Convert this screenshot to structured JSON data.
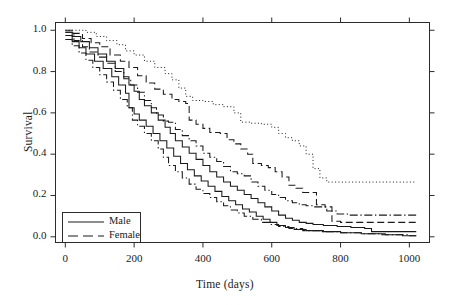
{
  "chart_data": {
    "type": "line",
    "title": "",
    "xlabel": "Time (days)",
    "ylabel": "Survival",
    "xlim": [
      -30,
      1060
    ],
    "ylim": [
      -0.03,
      1.04
    ],
    "xticks": [
      0,
      200,
      400,
      600,
      800,
      1000
    ],
    "xtick_labels": [
      "0",
      "200",
      "400",
      "600",
      "800",
      "1000"
    ],
    "yticks": [
      0.0,
      0.2,
      0.4,
      0.6,
      0.8,
      1.0
    ],
    "ytick_labels": [
      "0.0",
      "0.2",
      "0.4",
      "0.6",
      "0.8",
      "1.0"
    ],
    "grid": false,
    "legend_position": "lower left",
    "legend_entries": [
      {
        "label": "Male",
        "style": "solid"
      },
      {
        "label": "Female",
        "style": "dashed"
      }
    ],
    "series": [
      {
        "name": "Female group 1",
        "style": "dotted",
        "sex": "Female",
        "plateau": 0.265,
        "points": [
          [
            0,
            1.0
          ],
          [
            40,
            1.0
          ],
          [
            60,
            0.99
          ],
          [
            90,
            0.97
          ],
          [
            120,
            0.95
          ],
          [
            150,
            0.93
          ],
          [
            175,
            0.9
          ],
          [
            200,
            0.88
          ],
          [
            230,
            0.85
          ],
          [
            260,
            0.82
          ],
          [
            290,
            0.79
          ],
          [
            310,
            0.76
          ],
          [
            330,
            0.72
          ],
          [
            350,
            0.68
          ],
          [
            370,
            0.66
          ],
          [
            400,
            0.655
          ],
          [
            430,
            0.64
          ],
          [
            460,
            0.63
          ],
          [
            490,
            0.6
          ],
          [
            510,
            0.555
          ],
          [
            540,
            0.55
          ],
          [
            570,
            0.545
          ],
          [
            600,
            0.53
          ],
          [
            620,
            0.5
          ],
          [
            640,
            0.48
          ],
          [
            660,
            0.465
          ],
          [
            680,
            0.44
          ],
          [
            700,
            0.4
          ],
          [
            720,
            0.33
          ],
          [
            740,
            0.285
          ],
          [
            760,
            0.265
          ],
          [
            800,
            0.265
          ],
          [
            900,
            0.265
          ],
          [
            1000,
            0.265
          ],
          [
            1020,
            0.265
          ]
        ]
      },
      {
        "name": "Female group 2",
        "style": "dashed",
        "sex": "Female",
        "plateau": 0.07,
        "points": [
          [
            0,
            1.0
          ],
          [
            20,
            0.985
          ],
          [
            50,
            0.96
          ],
          [
            75,
            0.94
          ],
          [
            100,
            0.92
          ],
          [
            130,
            0.88
          ],
          [
            160,
            0.85
          ],
          [
            185,
            0.82
          ],
          [
            210,
            0.78
          ],
          [
            235,
            0.745
          ],
          [
            260,
            0.715
          ],
          [
            285,
            0.69
          ],
          [
            310,
            0.665
          ],
          [
            330,
            0.655
          ],
          [
            350,
            0.645
          ],
          [
            360,
            0.565
          ],
          [
            380,
            0.545
          ],
          [
            400,
            0.525
          ],
          [
            420,
            0.505
          ],
          [
            450,
            0.5
          ],
          [
            470,
            0.47
          ],
          [
            490,
            0.45
          ],
          [
            510,
            0.425
          ],
          [
            530,
            0.4
          ],
          [
            545,
            0.355
          ],
          [
            570,
            0.345
          ],
          [
            590,
            0.335
          ],
          [
            610,
            0.315
          ],
          [
            630,
            0.29
          ],
          [
            650,
            0.25
          ],
          [
            670,
            0.235
          ],
          [
            690,
            0.215
          ],
          [
            710,
            0.215
          ],
          [
            730,
            0.155
          ],
          [
            755,
            0.145
          ],
          [
            775,
            0.075
          ],
          [
            800,
            0.07
          ],
          [
            900,
            0.07
          ],
          [
            1000,
            0.07
          ],
          [
            1020,
            0.07
          ]
        ]
      },
      {
        "name": "Female group 3",
        "style": "dashdot",
        "sex": "Female",
        "plateau": 0.105,
        "points": [
          [
            0,
            0.99
          ],
          [
            25,
            0.95
          ],
          [
            50,
            0.92
          ],
          [
            70,
            0.895
          ],
          [
            95,
            0.87
          ],
          [
            120,
            0.84
          ],
          [
            145,
            0.8
          ],
          [
            170,
            0.765
          ],
          [
            190,
            0.735
          ],
          [
            210,
            0.7
          ],
          [
            230,
            0.66
          ],
          [
            250,
            0.625
          ],
          [
            265,
            0.59
          ],
          [
            285,
            0.56
          ],
          [
            300,
            0.555
          ],
          [
            320,
            0.52
          ],
          [
            340,
            0.49
          ],
          [
            360,
            0.465
          ],
          [
            380,
            0.44
          ],
          [
            400,
            0.405
          ],
          [
            420,
            0.385
          ],
          [
            440,
            0.365
          ],
          [
            460,
            0.34
          ],
          [
            480,
            0.315
          ],
          [
            500,
            0.305
          ],
          [
            520,
            0.295
          ],
          [
            540,
            0.265
          ],
          [
            560,
            0.245
          ],
          [
            580,
            0.225
          ],
          [
            600,
            0.205
          ],
          [
            620,
            0.19
          ],
          [
            640,
            0.175
          ],
          [
            660,
            0.165
          ],
          [
            680,
            0.155
          ],
          [
            700,
            0.15
          ],
          [
            720,
            0.145
          ],
          [
            740,
            0.145
          ],
          [
            760,
            0.125
          ],
          [
            790,
            0.11
          ],
          [
            820,
            0.105
          ],
          [
            900,
            0.105
          ],
          [
            1000,
            0.105
          ],
          [
            1020,
            0.105
          ]
        ]
      },
      {
        "name": "Male group 1",
        "style": "solid",
        "sex": "Male",
        "plateau": 0.025,
        "points": [
          [
            0,
            0.99
          ],
          [
            20,
            0.97
          ],
          [
            45,
            0.945
          ],
          [
            70,
            0.915
          ],
          [
            95,
            0.885
          ],
          [
            120,
            0.85
          ],
          [
            145,
            0.815
          ],
          [
            170,
            0.775
          ],
          [
            185,
            0.735
          ],
          [
            200,
            0.705
          ],
          [
            215,
            0.665
          ],
          [
            230,
            0.635
          ],
          [
            250,
            0.6
          ],
          [
            270,
            0.565
          ],
          [
            290,
            0.53
          ],
          [
            305,
            0.5
          ],
          [
            320,
            0.465
          ],
          [
            340,
            0.435
          ],
          [
            360,
            0.405
          ],
          [
            380,
            0.375
          ],
          [
            400,
            0.345
          ],
          [
            420,
            0.315
          ],
          [
            440,
            0.29
          ],
          [
            460,
            0.265
          ],
          [
            480,
            0.245
          ],
          [
            500,
            0.225
          ],
          [
            520,
            0.205
          ],
          [
            540,
            0.185
          ],
          [
            560,
            0.165
          ],
          [
            580,
            0.145
          ],
          [
            600,
            0.125
          ],
          [
            620,
            0.105
          ],
          [
            640,
            0.09
          ],
          [
            660,
            0.08
          ],
          [
            680,
            0.07
          ],
          [
            700,
            0.065
          ],
          [
            720,
            0.06
          ],
          [
            750,
            0.055
          ],
          [
            790,
            0.05
          ],
          [
            830,
            0.045
          ],
          [
            870,
            0.04
          ],
          [
            890,
            0.025
          ],
          [
            950,
            0.025
          ],
          [
            1000,
            0.025
          ],
          [
            1020,
            0.025
          ]
        ]
      },
      {
        "name": "Male group 2",
        "style": "solid",
        "sex": "Male",
        "plateau": 0.005,
        "points": [
          [
            0,
            0.975
          ],
          [
            20,
            0.945
          ],
          [
            40,
            0.915
          ],
          [
            60,
            0.885
          ],
          [
            85,
            0.85
          ],
          [
            110,
            0.815
          ],
          [
            135,
            0.775
          ],
          [
            155,
            0.735
          ],
          [
            175,
            0.695
          ],
          [
            185,
            0.625
          ],
          [
            200,
            0.595
          ],
          [
            215,
            0.565
          ],
          [
            235,
            0.535
          ],
          [
            255,
            0.5
          ],
          [
            275,
            0.465
          ],
          [
            295,
            0.43
          ],
          [
            315,
            0.39
          ],
          [
            335,
            0.355
          ],
          [
            355,
            0.325
          ],
          [
            375,
            0.295
          ],
          [
            395,
            0.27
          ],
          [
            415,
            0.245
          ],
          [
            435,
            0.22
          ],
          [
            455,
            0.195
          ],
          [
            475,
            0.175
          ],
          [
            495,
            0.155
          ],
          [
            515,
            0.135
          ],
          [
            535,
            0.12
          ],
          [
            555,
            0.1
          ],
          [
            575,
            0.085
          ],
          [
            595,
            0.07
          ],
          [
            615,
            0.055
          ],
          [
            640,
            0.045
          ],
          [
            665,
            0.035
          ],
          [
            700,
            0.03
          ],
          [
            750,
            0.025
          ],
          [
            800,
            0.02
          ],
          [
            860,
            0.015
          ],
          [
            920,
            0.01
          ],
          [
            980,
            0.005
          ],
          [
            1020,
            0.005
          ]
        ]
      },
      {
        "name": "Male group 3",
        "style": "dashdot",
        "sex": "Male",
        "plateau": 0.005,
        "points": [
          [
            0,
            0.955
          ],
          [
            20,
            0.925
          ],
          [
            40,
            0.89
          ],
          [
            60,
            0.855
          ],
          [
            80,
            0.82
          ],
          [
            100,
            0.785
          ],
          [
            120,
            0.75
          ],
          [
            140,
            0.71
          ],
          [
            160,
            0.665
          ],
          [
            180,
            0.625
          ],
          [
            195,
            0.565
          ],
          [
            210,
            0.535
          ],
          [
            230,
            0.5
          ],
          [
            250,
            0.465
          ],
          [
            270,
            0.425
          ],
          [
            285,
            0.385
          ],
          [
            300,
            0.345
          ],
          [
            320,
            0.315
          ],
          [
            340,
            0.285
          ],
          [
            360,
            0.255
          ],
          [
            380,
            0.23
          ],
          [
            400,
            0.21
          ],
          [
            420,
            0.19
          ],
          [
            440,
            0.17
          ],
          [
            460,
            0.15
          ],
          [
            480,
            0.13
          ],
          [
            500,
            0.115
          ],
          [
            520,
            0.1
          ],
          [
            545,
            0.085
          ],
          [
            570,
            0.07
          ],
          [
            595,
            0.06
          ],
          [
            620,
            0.05
          ],
          [
            650,
            0.04
          ],
          [
            690,
            0.03
          ],
          [
            740,
            0.025
          ],
          [
            800,
            0.02
          ],
          [
            860,
            0.015
          ],
          [
            930,
            0.01
          ],
          [
            1000,
            0.005
          ],
          [
            1020,
            0.005
          ]
        ]
      }
    ]
  }
}
